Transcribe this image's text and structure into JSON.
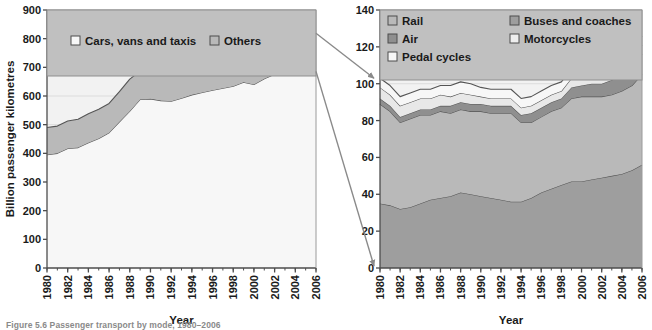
{
  "figure": {
    "caption": "Figure 5.6 Passenger transport by mode, 1980–2006",
    "background": "#ffffff"
  },
  "colors": {
    "plot_bg": "#f2f2f2",
    "legend_bg": "#c0c0c0",
    "band_white": "#f7f7f7",
    "band_light": "#d6d6d6",
    "band_mid": "#b9b9b9",
    "band_dark": "#9e9e9e",
    "band_darker": "#8f8f8f",
    "outline": "#555555",
    "grid": "#dcdcdc",
    "axis": "#4d4d4d",
    "connector": "#8a8a8a"
  },
  "chart_data": [
    {
      "id": "left",
      "type": "area",
      "stacked": true,
      "title": "",
      "xlabel": "Year",
      "ylabel": "Billion passenger kilometres",
      "xlim": [
        1980,
        2006
      ],
      "ylim": [
        0,
        900
      ],
      "yticks": [
        0,
        100,
        200,
        300,
        400,
        500,
        600,
        700,
        800,
        900
      ],
      "xticks": [
        1980,
        1982,
        1984,
        1986,
        1988,
        1990,
        1992,
        1994,
        1996,
        1998,
        2000,
        2002,
        2004,
        2006
      ],
      "xtick_labels": [
        "1980",
        "1982",
        "1984",
        "1986",
        "1988",
        "1990",
        "1992",
        "1994",
        "1996",
        "1998",
        "2000",
        "2002",
        "2004",
        "2006"
      ],
      "ytick_labels": [
        "0",
        "100",
        "200",
        "300",
        "400",
        "500",
        "600",
        "700",
        "800",
        "900"
      ],
      "grid": true,
      "legend_position": "top",
      "x": [
        1980,
        1981,
        1982,
        1983,
        1984,
        1985,
        1986,
        1987,
        1988,
        1989,
        1990,
        1991,
        1992,
        1993,
        1994,
        1995,
        1996,
        1997,
        1998,
        1999,
        2000,
        2001,
        2002,
        2003,
        2004,
        2005,
        2006
      ],
      "series": [
        {
          "name": "Cars, vans and taxis",
          "color": "#f7f7f7",
          "values": [
            395,
            400,
            417,
            420,
            437,
            452,
            472,
            510,
            547,
            588,
            590,
            584,
            582,
            592,
            604,
            612,
            620,
            627,
            634,
            648,
            640,
            660,
            676,
            680,
            682,
            685,
            686
          ]
        },
        {
          "name": "Others",
          "color": "#b9b9b9",
          "values": [
            95,
            95,
            96,
            99,
            101,
            102,
            102,
            105,
            112,
            99,
            96,
            93,
            93,
            96,
            104,
            106,
            108,
            113,
            118,
            112,
            120,
            132,
            122,
            124,
            126,
            130,
            133
          ]
        }
      ],
      "totals": [
        490,
        495,
        513,
        519,
        538,
        554,
        574,
        615,
        659,
        687,
        686,
        677,
        675,
        688,
        708,
        718,
        728,
        740,
        752,
        760,
        760,
        792,
        798,
        804,
        808,
        815,
        819
      ]
    },
    {
      "id": "right",
      "type": "area",
      "stacked": true,
      "title": "",
      "xlabel": "Year",
      "ylabel": "",
      "xlim": [
        1980,
        2006
      ],
      "ylim": [
        0,
        140
      ],
      "yticks": [
        0,
        20,
        40,
        60,
        80,
        100,
        120,
        140
      ],
      "xticks": [
        1980,
        1982,
        1984,
        1986,
        1988,
        1990,
        1992,
        1994,
        1996,
        1998,
        2000,
        2002,
        2004,
        2006
      ],
      "xtick_labels": [
        "1980",
        "1982",
        "1984",
        "1986",
        "1988",
        "1990",
        "1992",
        "1994",
        "1996",
        "1998",
        "2000",
        "2002",
        "2004",
        "2006"
      ],
      "ytick_labels": [
        "0",
        "20",
        "40",
        "60",
        "80",
        "100",
        "120",
        "140"
      ],
      "grid": true,
      "legend_position": "top",
      "x": [
        1980,
        1981,
        1982,
        1983,
        1984,
        1985,
        1986,
        1987,
        1988,
        1989,
        1990,
        1991,
        1992,
        1993,
        1994,
        1995,
        1996,
        1997,
        1998,
        1999,
        2000,
        2001,
        2002,
        2003,
        2004,
        2005,
        2006
      ],
      "series": [
        {
          "name": "Buses and coaches",
          "color": "#9e9e9e",
          "values": [
            35,
            34,
            32,
            33,
            35,
            37,
            38,
            39,
            41,
            40,
            39,
            38,
            37,
            36,
            36,
            38,
            41,
            43,
            45,
            47,
            47,
            48,
            49,
            50,
            51,
            53,
            56
          ]
        },
        {
          "name": "Rail",
          "color": "#b9b9b9",
          "values": [
            54,
            51,
            47,
            48,
            48,
            46,
            47,
            45,
            45,
            45,
            46,
            46,
            47,
            48,
            43,
            41,
            41,
            42,
            42,
            45,
            46,
            45,
            44,
            44,
            45,
            46,
            49
          ]
        },
        {
          "name": "Air",
          "color": "#8f8f8f",
          "values": [
            3,
            3,
            3,
            3,
            3,
            3,
            3,
            4,
            4,
            4,
            4,
            4,
            4,
            4,
            4,
            5,
            5,
            5,
            5,
            6,
            6,
            7,
            7,
            8,
            9,
            10,
            11
          ]
        },
        {
          "name": "Motorcycles",
          "color": "#e8e8e8",
          "values": [
            6,
            6,
            6,
            6,
            6,
            6,
            6,
            5,
            5,
            5,
            4,
            4,
            4,
            4,
            4,
            4,
            4,
            4,
            4,
            5,
            5,
            5,
            5,
            5,
            5,
            5,
            5
          ]
        },
        {
          "name": "Pedal cycles",
          "color": "#f7f7f7",
          "values": [
            5,
            5,
            5,
            5,
            5,
            5,
            5,
            6,
            6,
            6,
            5,
            5,
            5,
            5,
            5,
            5,
            5,
            5,
            5,
            5,
            5,
            5,
            5,
            5,
            5,
            5,
            5
          ]
        }
      ],
      "totals": [
        103,
        99,
        93,
        95,
        97,
        97,
        99,
        99,
        101,
        100,
        98,
        97,
        97,
        97,
        92,
        93,
        96,
        99,
        101,
        108,
        109,
        110,
        110,
        112,
        115,
        119,
        126
      ]
    }
  ],
  "left_panel": {
    "legend": {
      "items": [
        {
          "label": "Cars, vans and taxis",
          "swatch": "#f7f7f7"
        },
        {
          "label": "Others",
          "swatch": "#b9b9b9"
        }
      ]
    },
    "y_axis_title": "Billion passenger kilometres",
    "x_axis_title": "Year"
  },
  "right_panel": {
    "legend": {
      "items": [
        {
          "label": "Rail",
          "swatch": "#b9b9b9"
        },
        {
          "label": "Buses and coaches",
          "swatch": "#9e9e9e"
        },
        {
          "label": "Air",
          "swatch": "#8f8f8f"
        },
        {
          "label": "Motorcycles",
          "swatch": "#eeeeee"
        },
        {
          "label": "Pedal cycles",
          "swatch": "#f7f7f7"
        }
      ]
    },
    "x_axis_title": "Year"
  },
  "connectors": {
    "count": 2,
    "description": "Two callout lines from the 2006 edge of the Others band in the left chart to the top and bottom of the right chart"
  }
}
